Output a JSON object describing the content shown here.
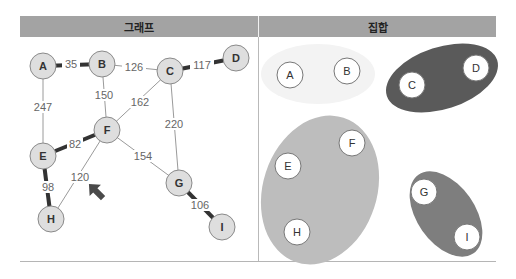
{
  "panels": {
    "left_title": "그래프",
    "right_title": "집합"
  },
  "graph": {
    "node_fill": "#dedede",
    "node_stroke": "#8a8a8a",
    "nodes": [
      {
        "id": "A",
        "x": 43,
        "y": 66
      },
      {
        "id": "B",
        "x": 102,
        "y": 64
      },
      {
        "id": "C",
        "x": 170,
        "y": 71
      },
      {
        "id": "D",
        "x": 236,
        "y": 58
      },
      {
        "id": "E",
        "x": 43,
        "y": 156
      },
      {
        "id": "F",
        "x": 107,
        "y": 130
      },
      {
        "id": "G",
        "x": 179,
        "y": 183
      },
      {
        "id": "H",
        "x": 51,
        "y": 219
      },
      {
        "id": "I",
        "x": 222,
        "y": 227
      }
    ],
    "edges": [
      {
        "from": "A",
        "to": "B",
        "weight": "35",
        "bold": true
      },
      {
        "from": "B",
        "to": "C",
        "weight": "126",
        "bold": false
      },
      {
        "from": "C",
        "to": "D",
        "weight": "117",
        "bold": true
      },
      {
        "from": "A",
        "to": "E",
        "weight": "247",
        "bold": false
      },
      {
        "from": "B",
        "to": "F",
        "weight": "150",
        "bold": false
      },
      {
        "from": "C",
        "to": "F",
        "weight": "162",
        "bold": false
      },
      {
        "from": "C",
        "to": "G",
        "weight": "220",
        "bold": false
      },
      {
        "from": "E",
        "to": "F",
        "weight": "82",
        "bold": true
      },
      {
        "from": "F",
        "to": "G",
        "weight": "154",
        "bold": false
      },
      {
        "from": "F",
        "to": "H",
        "weight": "120",
        "bold": false
      },
      {
        "from": "E",
        "to": "H",
        "weight": "98",
        "bold": true
      },
      {
        "from": "G",
        "to": "I",
        "weight": "106",
        "bold": true
      }
    ],
    "pointer": {
      "icon": "arrow-up-left-icon",
      "x": 94,
      "y": 190,
      "color": "#4a4a4a"
    }
  },
  "sets": [
    {
      "name": "set-ab",
      "color": "#f3f3f3",
      "members": [
        "A",
        "B"
      ]
    },
    {
      "name": "set-cd",
      "color": "#5a5a5a",
      "members": [
        "C",
        "D"
      ]
    },
    {
      "name": "set-efh",
      "color": "#bdbdbd",
      "members": [
        "E",
        "F",
        "H"
      ]
    },
    {
      "name": "set-gi",
      "color": "#7e7e7e",
      "members": [
        "G",
        "I"
      ]
    }
  ]
}
